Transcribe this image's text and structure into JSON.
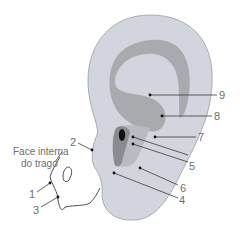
{
  "diagram": {
    "colors": {
      "auricle": "#d3d5de",
      "auricle_stroke": "#9a9ca4",
      "inner_region": "#a9aaae",
      "concha": "#8a8b8f",
      "canal": "#111111",
      "leader_line": "#3a3a3a",
      "point": "#111111",
      "label_text": "#6e6e6e"
    },
    "annotation": {
      "line1": "Face interna",
      "line2": "do trago"
    },
    "labels": [
      {
        "id": "1",
        "text": "1"
      },
      {
        "id": "2",
        "text": "2"
      },
      {
        "id": "3",
        "text": "3"
      },
      {
        "id": "4",
        "text": "4"
      },
      {
        "id": "5",
        "text": "5"
      },
      {
        "id": "6",
        "text": "6"
      },
      {
        "id": "7",
        "text": "7"
      },
      {
        "id": "8",
        "text": "8"
      },
      {
        "id": "9",
        "text": "9"
      }
    ]
  }
}
